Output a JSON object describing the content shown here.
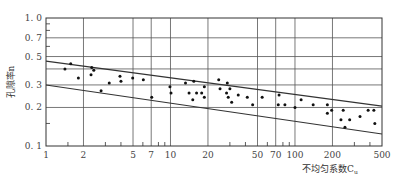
{
  "chart_data": {
    "type": "scatter",
    "title": "",
    "xlabel": "不均匀系数C",
    "xlabel_subscript": "u",
    "ylabel": "孔隙率n",
    "x_scale": "log",
    "y_scale": "log",
    "xlim": [
      1,
      500
    ],
    "ylim": [
      0.1,
      1.0
    ],
    "x_ticks": [
      1,
      2,
      5,
      7,
      10,
      20,
      50,
      70,
      100,
      200,
      500
    ],
    "x_tick_labels": [
      "1",
      "2",
      "5",
      "7",
      "10",
      "20",
      "50",
      "70",
      "100",
      "200",
      "500"
    ],
    "x_minor_ticks": [
      1.5,
      3,
      4,
      6,
      8,
      9,
      30,
      40,
      60,
      80,
      90,
      300,
      400
    ],
    "y_ticks": [
      0.1,
      0.2,
      0.3,
      0.5,
      0.7,
      1.0
    ],
    "y_tick_labels": [
      "0.1",
      "0.2",
      "0.3",
      "0.5",
      "0.7",
      "1.0"
    ],
    "y_gridlines": [
      0.2,
      0.3,
      0.4,
      0.5,
      0.7
    ],
    "x_gridlines": [
      2,
      5,
      7,
      10,
      20,
      50,
      70,
      100,
      200
    ],
    "grid": true,
    "legend": null,
    "series": [
      {
        "name": "measured",
        "marker": "dot",
        "points": [
          [
            1.42,
            0.4
          ],
          [
            1.58,
            0.44
          ],
          [
            1.82,
            0.34
          ],
          [
            2.33,
            0.41
          ],
          [
            2.42,
            0.39
          ],
          [
            2.3,
            0.36
          ],
          [
            2.77,
            0.27
          ],
          [
            3.22,
            0.31
          ],
          [
            3.93,
            0.35
          ],
          [
            4.0,
            0.32
          ],
          [
            4.97,
            0.34
          ],
          [
            6.05,
            0.33
          ],
          [
            7.07,
            0.24
          ],
          [
            9.9,
            0.29
          ],
          [
            10.1,
            0.26
          ],
          [
            13.2,
            0.31
          ],
          [
            15.4,
            0.32
          ],
          [
            14.1,
            0.26
          ],
          [
            16.2,
            0.26
          ],
          [
            17.8,
            0.26
          ],
          [
            18.7,
            0.29
          ],
          [
            15.1,
            0.23
          ],
          [
            18.7,
            0.24
          ],
          [
            24.4,
            0.33
          ],
          [
            28.6,
            0.31
          ],
          [
            25.0,
            0.28
          ],
          [
            28.2,
            0.26
          ],
          [
            30.0,
            0.28
          ],
          [
            29.1,
            0.24
          ],
          [
            31.0,
            0.22
          ],
          [
            35.0,
            0.25
          ],
          [
            41.4,
            0.24
          ],
          [
            45.7,
            0.21
          ],
          [
            54.5,
            0.24
          ],
          [
            74.5,
            0.25
          ],
          [
            73.4,
            0.21
          ],
          [
            83.0,
            0.21
          ],
          [
            100,
            0.2
          ],
          [
            112,
            0.23
          ],
          [
            140,
            0.21
          ],
          [
            182,
            0.21
          ],
          [
            182,
            0.18
          ],
          [
            197,
            0.19
          ],
          [
            244,
            0.19
          ],
          [
            234,
            0.16
          ],
          [
            275,
            0.16
          ],
          [
            252,
            0.14
          ],
          [
            333,
            0.17
          ],
          [
            387,
            0.19
          ],
          [
            430,
            0.19
          ],
          [
            438,
            0.15
          ]
        ]
      }
    ],
    "envelope_lines": [
      {
        "name": "upper-bound",
        "from": [
          1,
          0.46
        ],
        "to": [
          500,
          0.205
        ]
      },
      {
        "name": "lower-bound",
        "from": [
          1,
          0.3
        ],
        "to": [
          500,
          0.124
        ]
      }
    ]
  },
  "layout": {
    "plot": {
      "left": 46,
      "top": 18,
      "right": 382,
      "bottom": 146
    },
    "colors": {
      "line": "#333333",
      "grid": "#555555",
      "point": "#111111",
      "text": "#444444"
    }
  }
}
